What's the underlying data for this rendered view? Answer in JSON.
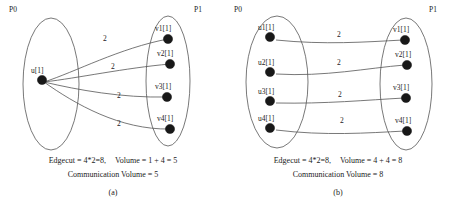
{
  "figure": {
    "type": "graph-partitioning-comparison",
    "panels": [
      {
        "tag": "(a)",
        "partitions": [
          {
            "name": "P0",
            "label": "P0"
          },
          {
            "name": "P1",
            "label": "P1"
          }
        ],
        "left_vertices": [
          {
            "label": "u[1]",
            "cx": 42,
            "cy": 80
          }
        ],
        "right_vertices": [
          {
            "label": "v1[1]",
            "cx": 168,
            "cy": 39
          },
          {
            "label": "v2[1]",
            "cx": 170,
            "cy": 64
          },
          {
            "label": "v3[1]",
            "cx": 167,
            "cy": 97
          },
          {
            "label": "v4[1]",
            "cx": 170,
            "cy": 129
          }
        ],
        "edges": [
          {
            "from": "u[1]",
            "to": "v1[1]",
            "weight": "2",
            "lx": 103,
            "ly": 35
          },
          {
            "from": "u[1]",
            "to": "v2[1]",
            "weight": "2",
            "lx": 111,
            "ly": 63
          },
          {
            "from": "u[1]",
            "to": "v3[1]",
            "weight": "2",
            "lx": 117,
            "ly": 92
          },
          {
            "from": "u[1]",
            "to": "v4[1]",
            "weight": "2",
            "lx": 117,
            "ly": 120
          }
        ],
        "metrics": {
          "edgecut": "Edgecut = 4*2=8,",
          "volume": "Volume = 1 + 4 = 5",
          "communication_volume": "Communication Volume = 5"
        }
      },
      {
        "tag": "(b)",
        "partitions": [
          {
            "name": "P0",
            "label": "P0"
          },
          {
            "name": "P1",
            "label": "P1"
          }
        ],
        "left_vertices": [
          {
            "label": "u1[1]",
            "cx": 197,
            "cy": 37
          },
          {
            "label": "u2[1]",
            "cx": 197,
            "cy": 72
          },
          {
            "label": "u3[1]",
            "cx": 197,
            "cy": 101
          },
          {
            "label": "u4[1]",
            "cx": 197,
            "cy": 128
          }
        ],
        "right_vertices": [
          {
            "label": "v1[1]",
            "cx": 403,
            "cy": 40
          },
          {
            "label": "v2[1]",
            "cx": 405,
            "cy": 65
          },
          {
            "label": "v3[1]",
            "cx": 404,
            "cy": 98
          },
          {
            "label": "v4[1]",
            "cx": 405,
            "cy": 131
          }
        ],
        "edges": [
          {
            "from": "u1[1]",
            "to": "v1[1]",
            "weight": "2",
            "lx": 337,
            "ly": 34
          },
          {
            "from": "u2[1]",
            "to": "v2[1]",
            "weight": "2",
            "lx": 337,
            "ly": 62
          },
          {
            "from": "u3[1]",
            "to": "v3[1]",
            "weight": "2",
            "lx": 338,
            "ly": 94
          },
          {
            "from": "u4[1]",
            "to": "v4[1]",
            "weight": "2",
            "lx": 340,
            "ly": 120
          }
        ],
        "metrics": {
          "edgecut": "Edgecut = 4*2=8,",
          "volume": "Volume = 4 + 4 = 8",
          "communication_volume": "Communication Volume = 8"
        }
      }
    ]
  },
  "colors": {
    "vertex_fill": "#181818",
    "stroke": "#555555",
    "text": "#1a1a1a",
    "background": "#ffffff"
  }
}
